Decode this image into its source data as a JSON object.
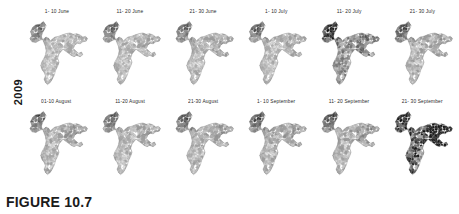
{
  "figure": {
    "caption": "FIGURE 10.7",
    "year_label": "2009"
  },
  "chart_data": {
    "type": "heatmap",
    "title": "FIGURE 10.7",
    "subtitle": "",
    "xlabel": "",
    "ylabel": "2009",
    "legend_position": "none",
    "grid": false,
    "layout": {
      "rows": 2,
      "cols": 6,
      "small_multiples": true
    },
    "map_region": "India (district-level choropleth)",
    "color_scale": {
      "type": "sequential-gray",
      "low": "#ffffff",
      "high": "#1a1a1a",
      "boundary": "#8a8a8a"
    },
    "categories": [
      "1- 10 June",
      "11- 20 June",
      "21- 30 June",
      "1- 10 July",
      "11- 20 July",
      "21- 30 July",
      "01-10 August",
      "11-20 August",
      "21-30 August",
      "1- 10 September",
      "11- 20 September",
      "21- 30 September"
    ],
    "values": [
      0.26,
      0.27,
      0.28,
      0.27,
      0.46,
      0.31,
      0.3,
      0.29,
      0.3,
      0.31,
      0.33,
      0.78
    ],
    "series": [
      {
        "name": "Relative mean intensity (darkness of choropleth)",
        "values": [
          0.26,
          0.27,
          0.28,
          0.27,
          0.46,
          0.31,
          0.3,
          0.29,
          0.3,
          0.31,
          0.33,
          0.78
        ]
      }
    ],
    "ylim": [
      0,
      1
    ],
    "annotations": [
      "Panel '11- 20 July' shows elevated intensity in the north-west.",
      "Panel '21- 30 September' is the darkest overall, with strongest values in the east."
    ]
  },
  "panels": [
    {
      "label": "1- 10 June",
      "intensity": 0.26,
      "hot_nw": 0.55,
      "hot_e": 0.1
    },
    {
      "label": "11- 20 June",
      "intensity": 0.27,
      "hot_nw": 0.55,
      "hot_e": 0.1
    },
    {
      "label": "21- 30 June",
      "intensity": 0.28,
      "hot_nw": 0.52,
      "hot_e": 0.12
    },
    {
      "label": "1- 10 July",
      "intensity": 0.27,
      "hot_nw": 0.58,
      "hot_e": 0.1
    },
    {
      "label": "11- 20 July",
      "intensity": 0.46,
      "hot_nw": 0.92,
      "hot_e": 0.16
    },
    {
      "label": "21- 30 July",
      "intensity": 0.31,
      "hot_nw": 0.62,
      "hot_e": 0.12
    },
    {
      "label": "01-10 August",
      "intensity": 0.3,
      "hot_nw": 0.6,
      "hot_e": 0.12
    },
    {
      "label": "11-20 August",
      "intensity": 0.29,
      "hot_nw": 0.56,
      "hot_e": 0.12
    },
    {
      "label": "21-30 August",
      "intensity": 0.3,
      "hot_nw": 0.58,
      "hot_e": 0.12
    },
    {
      "label": "1- 10 September",
      "intensity": 0.31,
      "hot_nw": 0.62,
      "hot_e": 0.14
    },
    {
      "label": "11- 20 September",
      "intensity": 0.33,
      "hot_nw": 0.6,
      "hot_e": 0.16
    },
    {
      "label": "21- 30 September",
      "intensity": 0.78,
      "hot_nw": 0.55,
      "hot_e": 0.95
    }
  ]
}
